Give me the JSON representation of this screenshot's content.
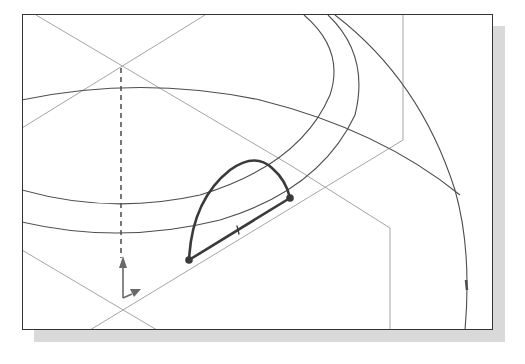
{
  "figure": {
    "type": "CAD sketch viewport",
    "colors": {
      "frame": "#333333",
      "shadow": "#d9d9d9",
      "construction_line": "#a0a0a0",
      "arc_curve": "#4a4a4a",
      "profile": "#3a3a3a",
      "background": "#ffffff"
    },
    "elements": {
      "profile": {
        "arc": "semi-elliptical arc",
        "line": "chord with midpoint tick",
        "endpoints": 2
      },
      "triad": {
        "axes": [
          "vertical-arrow",
          "diagonal-arrow"
        ]
      },
      "dashed_axis": "vertical centerline"
    }
  }
}
